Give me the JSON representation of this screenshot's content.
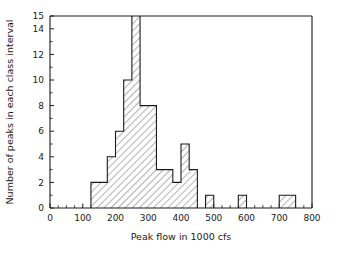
{
  "chart_data": {
    "type": "bar",
    "title": "",
    "subtitle": "",
    "xlabel": "Peak flow in 1000 cfs",
    "ylabel": "Number of peaks in each class interval",
    "xlim": [
      0,
      800
    ],
    "ylim": [
      0,
      15
    ],
    "grid": false,
    "legend": null,
    "bin_width": 25,
    "note": "Histogram; the class interval 250-275 exceeds the plotted y-axis maximum and is clipped at 15.",
    "xticks": [
      0,
      100,
      200,
      300,
      400,
      500,
      600,
      700,
      800
    ],
    "xtick_labels": [
      "0",
      "100",
      "200",
      "300",
      "400",
      "500",
      "600",
      "700",
      "800"
    ],
    "x_minor_tick_step": 25,
    "yticks": [
      0,
      2,
      4,
      6,
      8,
      10,
      12,
      14,
      15
    ],
    "ytick_labels": [
      "0",
      "2",
      "4",
      "6",
      "8",
      "10",
      "12",
      "14",
      "15"
    ],
    "y_minor_tick_step": 1,
    "bins": [
      {
        "start": 125,
        "end": 150,
        "value": 2
      },
      {
        "start": 150,
        "end": 175,
        "value": 2
      },
      {
        "start": 175,
        "end": 200,
        "value": 4
      },
      {
        "start": 200,
        "end": 225,
        "value": 6
      },
      {
        "start": 225,
        "end": 250,
        "value": 10
      },
      {
        "start": 250,
        "end": 275,
        "value": 15
      },
      {
        "start": 275,
        "end": 300,
        "value": 8
      },
      {
        "start": 300,
        "end": 325,
        "value": 8
      },
      {
        "start": 325,
        "end": 350,
        "value": 3
      },
      {
        "start": 350,
        "end": 375,
        "value": 3
      },
      {
        "start": 375,
        "end": 400,
        "value": 2
      },
      {
        "start": 400,
        "end": 425,
        "value": 5
      },
      {
        "start": 425,
        "end": 450,
        "value": 3
      },
      {
        "start": 475,
        "end": 500,
        "value": 1
      },
      {
        "start": 575,
        "end": 600,
        "value": 1
      },
      {
        "start": 700,
        "end": 750,
        "value": 1
      }
    ],
    "categories": [
      "125-150",
      "150-175",
      "175-200",
      "200-225",
      "225-250",
      "250-275",
      "275-300",
      "300-325",
      "325-350",
      "350-375",
      "375-400",
      "400-425",
      "425-450",
      "475-500",
      "575-600",
      "700-750"
    ],
    "values": [
      2,
      2,
      4,
      6,
      10,
      15,
      8,
      8,
      3,
      3,
      2,
      5,
      3,
      1,
      1,
      1
    ],
    "colors": {
      "axis": "#1a1a1a",
      "bar_outline": "#1a1a1a",
      "bar_fill": "#ffffff",
      "hatch": "#555555",
      "background": "#ffffff"
    }
  }
}
